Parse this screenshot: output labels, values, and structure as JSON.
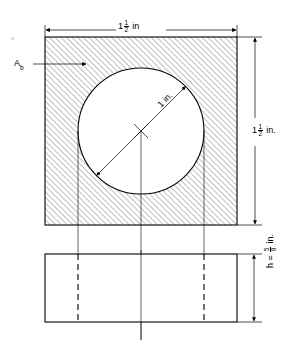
{
  "figure": {
    "kind": "engineering-drawing",
    "ink_color": "#000000",
    "hatch_color": "#4d4d4d",
    "background": "#ffffff"
  },
  "labels": {
    "top_dimension": {
      "whole": "1",
      "num": "1",
      "den": "2",
      "unit": "in"
    },
    "right_dimension": {
      "whole": "1",
      "num": "1",
      "den": "2",
      "unit": "in."
    },
    "diameter": {
      "whole": "1",
      "unit": "in."
    },
    "area_label": {
      "base": "A",
      "sub": "b"
    },
    "height_dimension": {
      "prefix": "h =",
      "num": "5",
      "den": "8",
      "unit": "in."
    }
  },
  "geometry": {
    "top_view": {
      "name": "hatched-square-plan",
      "left": 45,
      "top": 37,
      "right": 237,
      "bottom": 225,
      "hatch_angle_deg": 45,
      "hatch_spacing_px": 4
    },
    "hole": {
      "name": "circular-hole",
      "cx": 141,
      "cy": 131,
      "r": 63,
      "fill": "#ffffff"
    },
    "front_view": {
      "name": "front-elevation-rectangle",
      "left": 45,
      "top": 254,
      "right": 237,
      "bottom": 322
    },
    "hidden_edges_x": [
      78,
      204
    ],
    "center_line_x": 141
  }
}
